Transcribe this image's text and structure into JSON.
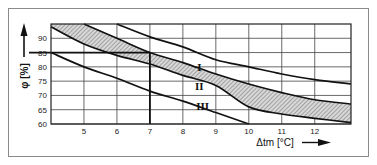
{
  "chart_data": {
    "type": "line",
    "title": "",
    "xlabel": "Δtm [°C]",
    "ylabel": "φ [%]",
    "xlim": [
      4,
      13.1
    ],
    "ylim": [
      60,
      95
    ],
    "x_ticks": [
      5,
      6,
      7,
      8,
      9,
      10,
      11,
      12
    ],
    "y_ticks": [
      60,
      65,
      70,
      75,
      80,
      85,
      90
    ],
    "grid": true,
    "series": [
      {
        "name": "upper-limit",
        "x": [
          6,
          7,
          8,
          9,
          10,
          11,
          12,
          13.1
        ],
        "y": [
          95,
          90.5,
          87,
          82.5,
          80,
          77.5,
          75.5,
          74
        ]
      },
      {
        "name": "band-upper",
        "x": [
          5,
          6,
          7,
          8,
          9,
          10,
          11,
          12,
          13.1
        ],
        "y": [
          95,
          90,
          85,
          81.5,
          77.5,
          74,
          71,
          68.5,
          67
        ]
      },
      {
        "name": "band-lower",
        "x": [
          4,
          5,
          6,
          7,
          8,
          9,
          10,
          11,
          12,
          13.1
        ],
        "y": [
          94,
          88,
          84,
          81,
          77,
          73.5,
          66,
          63.5,
          62,
          60.5
        ]
      },
      {
        "name": "lower-limit",
        "x": [
          4,
          5,
          6,
          7,
          8,
          9,
          10
        ],
        "y": [
          85,
          80,
          76,
          71.5,
          68,
          64,
          60
        ]
      }
    ],
    "shaded_band": {
      "between": [
        "band-upper",
        "band-lower"
      ],
      "pattern": "hatched"
    },
    "region_labels": [
      {
        "text": "I",
        "x": 8.5,
        "y": 78.5
      },
      {
        "text": "II",
        "x": 8.5,
        "y": 72
      },
      {
        "text": "III",
        "x": 8.6,
        "y": 65
      }
    ],
    "reference_lines": [
      {
        "type": "horizontal",
        "y": 85,
        "x_to": 7
      },
      {
        "type": "vertical",
        "x": 7,
        "y_to": 85
      }
    ]
  }
}
